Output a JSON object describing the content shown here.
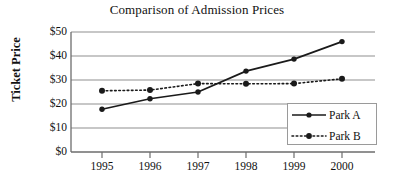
{
  "chart_data": {
    "type": "line",
    "title": "Comparison of Admission Prices",
    "xlabel": "",
    "ylabel": "Ticket Price",
    "categories": [
      "1995",
      "1996",
      "1997",
      "1998",
      "1999",
      "2000"
    ],
    "x": [
      1995,
      1996,
      1997,
      1998,
      1999,
      2000
    ],
    "series": [
      {
        "name": "Park A",
        "values": [
          17.8,
          22.2,
          25.0,
          33.7,
          38.7,
          46.0
        ],
        "line_style": "solid",
        "marker": "filled-circle",
        "color": "#1a1a1a"
      },
      {
        "name": "Park B",
        "values": [
          25.5,
          25.8,
          28.5,
          28.4,
          28.5,
          30.5
        ],
        "line_style": "dotted",
        "marker": "filled-circle",
        "color": "#1a1a1a"
      }
    ],
    "ylim": [
      0,
      50
    ],
    "yticks": [
      0,
      10,
      20,
      30,
      40,
      50
    ],
    "ytick_labels": [
      "$0",
      "$10",
      "$20",
      "$30",
      "$40",
      "$50"
    ],
    "grid": "horizontal",
    "legend_position": "bottom-right",
    "legend_entries": [
      "Park A",
      "Park B"
    ],
    "gridline_color": "#9a9a9a",
    "axis_color": "#6d6d6d",
    "background_color": "#ffffff"
  }
}
